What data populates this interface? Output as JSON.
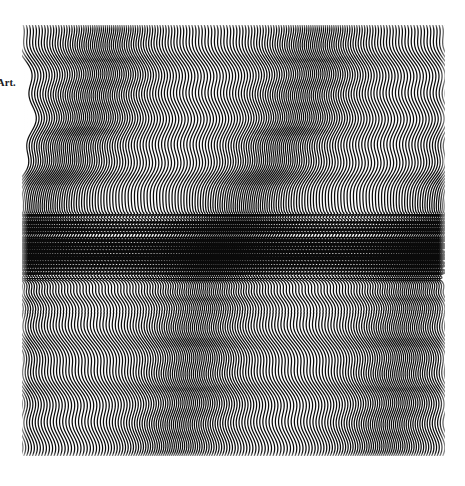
{
  "page": {
    "width": 465,
    "height": 486,
    "background_color": "#ffffff",
    "kind": "book-plate-reproduction"
  },
  "caption": {
    "text": "Art.",
    "x": 0,
    "y": 78,
    "font_size": 10.5,
    "color": "#1a1a1a",
    "clipped_at_left_edge": true
  },
  "artwork": {
    "title": "Op-art wave field",
    "x": 22,
    "y": 25,
    "width": 423,
    "height": 431,
    "ink_color": "#000000",
    "paper_color": "#ffffff"
  },
  "chart_data": {
    "type": "line",
    "xlabel": "",
    "ylabel": "",
    "grid": false,
    "legend": null,
    "xlim": [
      0,
      423
    ],
    "ylim": [
      0,
      431
    ],
    "line_spacing_px": 2.62,
    "stroke_width_px": 1.25,
    "line_count": 162,
    "vertical_samples": 431,
    "zones": [
      {
        "name": "upper-slow-wave",
        "y_start": 0,
        "y_end": 165,
        "cycles": 1.0,
        "amplitude_px": 15.0,
        "phase_deg": 0
      },
      {
        "name": "upper-transition",
        "y_start": 165,
        "y_end": 190,
        "cycles": 2.0,
        "amplitude_px": 9.0,
        "phase_deg": 40
      },
      {
        "name": "chevron-band-a",
        "y_start": 190,
        "y_end": 212,
        "cycles": 9.0,
        "amplitude_px": 6.0,
        "phase_deg": 180
      },
      {
        "name": "chevron-band-b",
        "y_start": 212,
        "y_end": 234,
        "cycles": 9.0,
        "amplitude_px": 6.0,
        "phase_deg": 0
      },
      {
        "name": "chevron-band-c",
        "y_start": 234,
        "y_end": 256,
        "cycles": 9.0,
        "amplitude_px": 6.0,
        "phase_deg": 180
      },
      {
        "name": "lower-transition",
        "y_start": 256,
        "y_end": 290,
        "cycles": 3.0,
        "amplitude_px": 10.0,
        "phase_deg": 0
      },
      {
        "name": "lower-slow-wave",
        "y_start": 290,
        "y_end": 431,
        "cycles": 1.2,
        "amplitude_px": 14.0,
        "phase_deg": 200
      }
    ],
    "modulation": {
      "primary": {
        "amplitude_px": 15.0,
        "wavelength_px": 330.0,
        "phase_deg": 0,
        "axis": "vertical"
      },
      "secondary": {
        "amplitude_px": 6.0,
        "wavelength_px": 47.0,
        "phase_deg": 90,
        "axis": "vertical"
      },
      "horizontal_drift": {
        "amplitude_px": 7.0,
        "wavelength_px": 210.0,
        "phase_deg": 35
      },
      "band_envelope_center_y": 223,
      "band_envelope_halfwidth_y": 40
    }
  }
}
